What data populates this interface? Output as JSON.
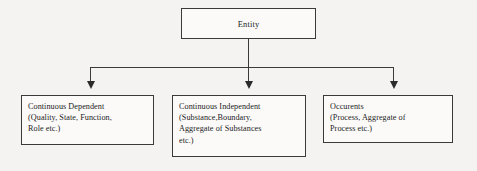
{
  "diagram": {
    "type": "hierarchy-tree",
    "orientation": "top-down",
    "colors": {
      "background": "#f4f3f1",
      "box_fill": "#fbfaf9",
      "box_border": "#3a3a3a",
      "connector": "#3a3a3a",
      "arrowhead": "#2b2b2b",
      "text": "#1c1c1c"
    },
    "root": {
      "id": "entity",
      "label": "Entity"
    },
    "children": [
      {
        "id": "continuous-dependent",
        "label": "Continuous Dependent\n(Quality, State, Function,\nRole etc.)",
        "justified": false
      },
      {
        "id": "continuous-independent",
        "label": "Continuous Independent\n(Substance,Boundary,\nAggregate of Substances\netc.)",
        "justified": true
      },
      {
        "id": "occurents",
        "label": "Occurents\n(Process, Aggregate of\nProcess etc.)",
        "justified": true
      }
    ],
    "connectors": [
      {
        "id": "root-stem",
        "from": "entity",
        "to": "bus"
      },
      {
        "id": "bus",
        "from": "root-stem",
        "to": "branch-stems"
      },
      {
        "id": "branch-0",
        "from": "bus",
        "to": "continuous-dependent",
        "arrow": "down-arrowhead"
      },
      {
        "id": "branch-1",
        "from": "bus",
        "to": "continuous-independent",
        "arrow": "down-arrowhead"
      },
      {
        "id": "branch-2",
        "from": "bus",
        "to": "occurents",
        "arrow": "down-arrowhead"
      }
    ]
  }
}
